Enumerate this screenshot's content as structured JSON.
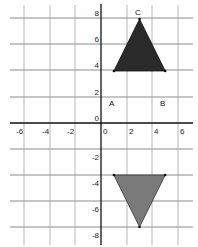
{
  "diagram": {
    "type": "coordinate-grid-reflection",
    "x_axis": {
      "min": -7,
      "max": 7,
      "tick_labels": [
        "-6",
        "-4",
        "-2",
        "0",
        "2",
        "4",
        "6"
      ]
    },
    "y_axis": {
      "min": -9,
      "max": 9,
      "tick_labels": [
        "8",
        "6",
        "4",
        "2",
        "0",
        "-2",
        "-4",
        "-6",
        "-8"
      ]
    },
    "shapes": [
      {
        "name": "triangle-ABC",
        "fill": "#2a2a2a",
        "vertices": [
          {
            "label": "A",
            "x": 1,
            "y": 4
          },
          {
            "label": "B",
            "x": 5,
            "y": 4
          },
          {
            "label": "C",
            "x": 3,
            "y": 8
          }
        ]
      },
      {
        "name": "triangle-reflected",
        "fill": "#7a7a7a",
        "vertices": [
          {
            "label": "",
            "x": 1,
            "y": -4
          },
          {
            "label": "",
            "x": 5,
            "y": -4
          },
          {
            "label": "",
            "x": 3,
            "y": -8
          }
        ]
      }
    ],
    "vertex_labels": {
      "A": "A",
      "B": "B",
      "C": "C"
    },
    "colors": {
      "grid": "#b8b8b8",
      "axis": "#111111",
      "triangle_top": "#2a2a2a",
      "triangle_bottom": "#7a7a7a"
    }
  }
}
